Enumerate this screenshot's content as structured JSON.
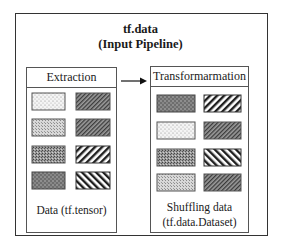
{
  "title": {
    "line1": "tf.data",
    "line2": "(Input Pipeline)"
  },
  "extraction": {
    "header": "Extraction",
    "caption_line1": "Data (tf.tensor)",
    "swatches": [
      {
        "row": 1,
        "col": 1,
        "pattern": "light-dots"
      },
      {
        "row": 1,
        "col": 2,
        "pattern": "dense-diagonal-dark"
      },
      {
        "row": 2,
        "col": 1,
        "pattern": "light-gray-stipple"
      },
      {
        "row": 2,
        "col": 2,
        "pattern": "dense-diagonal-dark"
      },
      {
        "row": 3,
        "col": 1,
        "pattern": "medium-gray-stipple"
      },
      {
        "row": 3,
        "col": 2,
        "pattern": "wide-backslash-stripes"
      },
      {
        "row": 4,
        "col": 1,
        "pattern": "dark-dots"
      },
      {
        "row": 4,
        "col": 2,
        "pattern": "wide-slash-stripes"
      }
    ]
  },
  "arrow": {
    "direction": "right",
    "from": "Extraction",
    "to": "Transformarmation"
  },
  "transformation": {
    "header": "Transformarmation",
    "caption_line1": "Shuffling data",
    "caption_line2": "(tf.data.Dataset)",
    "swatches": [
      {
        "row": 1,
        "col": 1,
        "pattern": "dark-dots"
      },
      {
        "row": 1,
        "col": 2,
        "pattern": "wide-backslash-stripes"
      },
      {
        "row": 2,
        "col": 1,
        "pattern": "light-dots"
      },
      {
        "row": 2,
        "col": 2,
        "pattern": "dense-diagonal-dark"
      },
      {
        "row": 3,
        "col": 1,
        "pattern": "medium-gray-stipple"
      },
      {
        "row": 3,
        "col": 2,
        "pattern": "wide-slash-stripes"
      },
      {
        "row": 4,
        "col": 1,
        "pattern": "light-gray-stipple"
      },
      {
        "row": 4,
        "col": 2,
        "pattern": "dense-diagonal-dark"
      }
    ]
  },
  "colors": {
    "border": "#333333",
    "text": "#1a1a1a",
    "background": "#ffffff"
  }
}
